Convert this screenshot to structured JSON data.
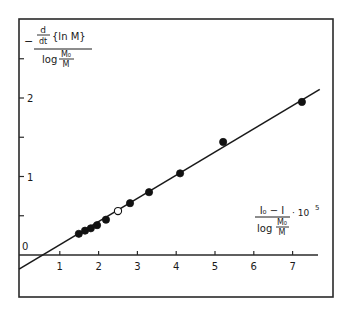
{
  "chart_data": {
    "type": "scatter",
    "title": "",
    "xlabel": {
      "numerator": "I₀ − I",
      "denominator_prefix": "log",
      "denominator_frac_num": "M₀",
      "denominator_frac_den": "M",
      "multiplier": "· 10",
      "exponent": "5"
    },
    "ylabel": {
      "sign": "−",
      "deriv_num": "d",
      "deriv_den": "dt",
      "expr": "{ln M}",
      "denominator_prefix": "log",
      "denominator_frac_num": "M₀",
      "denominator_frac_den": "M"
    },
    "xlim": [
      -0.05,
      8.0
    ],
    "ylim": [
      -0.54,
      3.0
    ],
    "x_ticks": [
      1,
      2,
      3,
      4,
      5,
      6,
      7
    ],
    "x_tick_labels": [
      "1",
      "2",
      "3",
      "4",
      "5",
      "6",
      "7"
    ],
    "y_ticks": [
      0.5,
      1,
      1.5,
      2,
      2.5
    ],
    "y_tick_labels": [
      "",
      "1",
      "",
      "2",
      ""
    ],
    "origin_label": "0",
    "grid": false,
    "legend": null,
    "series": [
      {
        "name": "filled points",
        "marker": "filled-circle",
        "x": [
          1.49,
          1.65,
          1.8,
          1.96,
          2.19,
          2.81,
          3.3,
          4.1,
          5.21,
          7.24
        ],
        "y": [
          0.27,
          0.31,
          0.34,
          0.38,
          0.45,
          0.66,
          0.8,
          1.04,
          1.44,
          1.95
        ]
      },
      {
        "name": "open point",
        "marker": "open-circle",
        "x": [
          2.5
        ],
        "y": [
          0.56
        ]
      }
    ],
    "fit_line": {
      "x": [
        -0.05,
        7.7
      ],
      "y": [
        -0.18,
        2.11
      ]
    }
  }
}
